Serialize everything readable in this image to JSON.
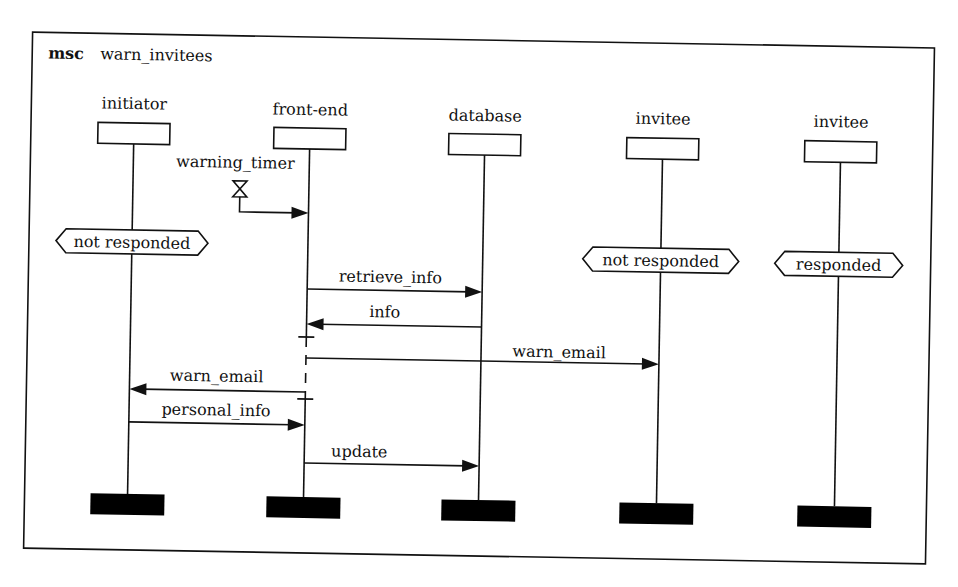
{
  "diagram": {
    "type": "message-sequence-chart",
    "keyword": "msc",
    "name": "warn_invitees",
    "frame": {
      "rotation_deg": 1.0,
      "x": 28,
      "y": 40,
      "width": 902,
      "height": 516
    },
    "colors": {
      "ink": "#111111",
      "background": "#ffffff"
    },
    "instances": [
      {
        "id": "initiator",
        "label": "initiator",
        "x": 126
      },
      {
        "id": "front-end",
        "label": "front-end",
        "x": 305
      },
      {
        "id": "database",
        "label": "database",
        "x": 482
      },
      {
        "id": "invitee1",
        "label": "invitee",
        "x": 662
      },
      {
        "id": "invitee2",
        "label": "invitee",
        "x": 842
      }
    ],
    "timer": {
      "label": "warning_timer",
      "instance": "front-end",
      "type": "timeout"
    },
    "conditions": [
      {
        "label": "not responded",
        "instance": "initiator"
      },
      {
        "label": "not responded",
        "instance": "invitee1"
      },
      {
        "label": "responded",
        "instance": "invitee2"
      }
    ],
    "coregion": {
      "instance": "front-end",
      "from": "after info",
      "to": "before personal_info"
    },
    "messages": [
      {
        "label": "retrieve_info",
        "from": "front-end",
        "to": "database"
      },
      {
        "label": "info",
        "from": "database",
        "to": "front-end"
      },
      {
        "label": "warn_email",
        "from": "front-end",
        "to": "invitee1"
      },
      {
        "label": "warn_email",
        "from": "front-end",
        "to": "initiator"
      },
      {
        "label": "personal_info",
        "from": "initiator",
        "to": "front-end"
      },
      {
        "label": "update",
        "from": "front-end",
        "to": "database"
      }
    ]
  }
}
